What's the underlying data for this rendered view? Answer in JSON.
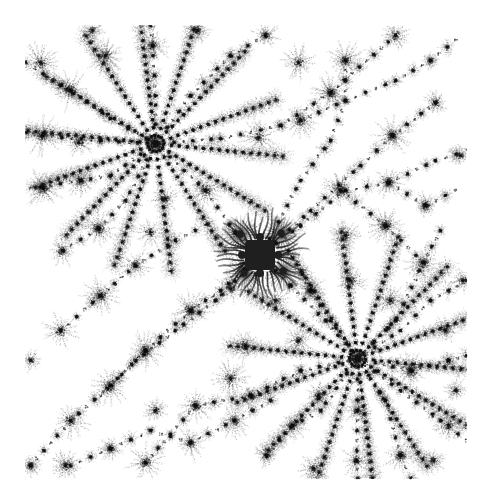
{
  "image": {
    "width": 491,
    "height": 504,
    "background": "#ffffff",
    "ink_color": "#1a1a1a",
    "content_bounds": {
      "x0": 25,
      "y0": 25,
      "x1": 466,
      "y1": 478
    }
  },
  "fractal": {
    "kind": "julia-like dendrite",
    "core": {
      "x": 260,
      "y": 255,
      "size": 30,
      "color": "#1f1f1f"
    },
    "core_satellites": [
      {
        "x": 240,
        "y": 234
      },
      {
        "x": 281,
        "y": 233
      },
      {
        "x": 244,
        "y": 273
      },
      {
        "x": 283,
        "y": 271
      }
    ],
    "major_hubs": [
      {
        "x": 155,
        "y": 143,
        "arms": 14,
        "radius": 135
      },
      {
        "x": 357,
        "y": 358,
        "arms": 14,
        "radius": 135
      }
    ],
    "minor_hubs": [
      {
        "x": 40,
        "y": 62,
        "r": 22
      },
      {
        "x": 70,
        "y": 90,
        "r": 22
      },
      {
        "x": 105,
        "y": 55,
        "r": 22
      },
      {
        "x": 152,
        "y": 45,
        "r": 20
      },
      {
        "x": 92,
        "y": 30,
        "r": 14
      },
      {
        "x": 197,
        "y": 30,
        "r": 16
      },
      {
        "x": 42,
        "y": 135,
        "r": 22
      },
      {
        "x": 78,
        "y": 142,
        "r": 18
      },
      {
        "x": 43,
        "y": 188,
        "r": 22
      },
      {
        "x": 80,
        "y": 180,
        "r": 18
      },
      {
        "x": 98,
        "y": 228,
        "r": 22
      },
      {
        "x": 150,
        "y": 232,
        "r": 20
      },
      {
        "x": 165,
        "y": 198,
        "r": 18
      },
      {
        "x": 205,
        "y": 190,
        "r": 24
      },
      {
        "x": 62,
        "y": 250,
        "r": 18
      },
      {
        "x": 235,
        "y": 232,
        "r": 14
      },
      {
        "x": 298,
        "y": 62,
        "r": 20
      },
      {
        "x": 265,
        "y": 35,
        "r": 16
      },
      {
        "x": 345,
        "y": 60,
        "r": 22
      },
      {
        "x": 395,
        "y": 35,
        "r": 18
      },
      {
        "x": 330,
        "y": 92,
        "r": 22
      },
      {
        "x": 300,
        "y": 120,
        "r": 20
      },
      {
        "x": 258,
        "y": 137,
        "r": 22
      },
      {
        "x": 392,
        "y": 135,
        "r": 22
      },
      {
        "x": 435,
        "y": 102,
        "r": 14
      },
      {
        "x": 388,
        "y": 182,
        "r": 18
      },
      {
        "x": 340,
        "y": 190,
        "r": 22
      },
      {
        "x": 425,
        "y": 205,
        "r": 16
      },
      {
        "x": 423,
        "y": 262,
        "r": 22
      },
      {
        "x": 462,
        "y": 280,
        "r": 14
      },
      {
        "x": 445,
        "y": 330,
        "r": 16
      },
      {
        "x": 411,
        "y": 370,
        "r": 22
      },
      {
        "x": 448,
        "y": 425,
        "r": 18
      },
      {
        "x": 433,
        "y": 460,
        "r": 14
      },
      {
        "x": 400,
        "y": 455,
        "r": 20
      },
      {
        "x": 356,
        "y": 460,
        "r": 18
      },
      {
        "x": 357,
        "y": 410,
        "r": 16
      },
      {
        "x": 313,
        "y": 468,
        "r": 18
      },
      {
        "x": 318,
        "y": 395,
        "r": 16
      },
      {
        "x": 292,
        "y": 425,
        "r": 18
      },
      {
        "x": 266,
        "y": 455,
        "r": 14
      },
      {
        "x": 234,
        "y": 420,
        "r": 20
      },
      {
        "x": 190,
        "y": 442,
        "r": 20
      },
      {
        "x": 145,
        "y": 462,
        "r": 22
      },
      {
        "x": 110,
        "y": 448,
        "r": 14
      },
      {
        "x": 65,
        "y": 465,
        "r": 18
      },
      {
        "x": 30,
        "y": 465,
        "r": 14
      },
      {
        "x": 70,
        "y": 420,
        "r": 22
      },
      {
        "x": 110,
        "y": 385,
        "r": 22
      },
      {
        "x": 145,
        "y": 350,
        "r": 22
      },
      {
        "x": 190,
        "y": 310,
        "r": 24
      },
      {
        "x": 230,
        "y": 288,
        "r": 18
      },
      {
        "x": 60,
        "y": 330,
        "r": 22
      },
      {
        "x": 100,
        "y": 295,
        "r": 22
      },
      {
        "x": 135,
        "y": 265,
        "r": 20
      },
      {
        "x": 30,
        "y": 360,
        "r": 14
      },
      {
        "x": 195,
        "y": 405,
        "r": 22
      },
      {
        "x": 155,
        "y": 410,
        "r": 14
      },
      {
        "x": 230,
        "y": 378,
        "r": 22
      },
      {
        "x": 245,
        "y": 345,
        "r": 18
      },
      {
        "x": 275,
        "y": 300,
        "r": 22
      },
      {
        "x": 298,
        "y": 340,
        "r": 16
      },
      {
        "x": 310,
        "y": 290,
        "r": 20
      },
      {
        "x": 350,
        "y": 280,
        "r": 18
      },
      {
        "x": 390,
        "y": 300,
        "r": 18
      },
      {
        "x": 385,
        "y": 225,
        "r": 22
      },
      {
        "x": 345,
        "y": 235,
        "r": 18
      },
      {
        "x": 460,
        "y": 155,
        "r": 14
      },
      {
        "x": 455,
        "y": 390,
        "r": 14
      }
    ],
    "chains": [
      [
        [
          25,
          62
        ],
        [
          70,
          90
        ],
        [
          110,
          118
        ],
        [
          155,
          143
        ]
      ],
      [
        [
          155,
          143
        ],
        [
          205,
          190
        ],
        [
          235,
          232
        ],
        [
          260,
          255
        ]
      ],
      [
        [
          260,
          255
        ],
        [
          290,
          285
        ],
        [
          325,
          320
        ],
        [
          357,
          358
        ]
      ],
      [
        [
          357,
          358
        ],
        [
          400,
          390
        ],
        [
          440,
          420
        ],
        [
          466,
          440
        ]
      ],
      [
        [
          155,
          143
        ],
        [
          220,
          138
        ],
        [
          280,
          125
        ],
        [
          330,
          92
        ],
        [
          395,
          35
        ]
      ],
      [
        [
          155,
          143
        ],
        [
          110,
          175
        ],
        [
          80,
          180
        ],
        [
          30,
          188
        ]
      ],
      [
        [
          155,
          143
        ],
        [
          155,
          95
        ],
        [
          152,
          45
        ],
        [
          150,
          25
        ]
      ],
      [
        [
          155,
          143
        ],
        [
          100,
          140
        ],
        [
          42,
          135
        ],
        [
          25,
          132
        ]
      ],
      [
        [
          155,
          143
        ],
        [
          125,
          200
        ],
        [
          98,
          228
        ],
        [
          62,
          250
        ]
      ],
      [
        [
          155,
          143
        ],
        [
          190,
          95
        ],
        [
          230,
          55
        ],
        [
          265,
          35
        ]
      ],
      [
        [
          260,
          255
        ],
        [
          300,
          225
        ],
        [
          345,
          190
        ],
        [
          388,
          182
        ],
        [
          435,
          160
        ],
        [
          466,
          150
        ]
      ],
      [
        [
          260,
          255
        ],
        [
          310,
          210
        ],
        [
          360,
          165
        ],
        [
          392,
          135
        ],
        [
          435,
          102
        ]
      ],
      [
        [
          260,
          255
        ],
        [
          300,
          180
        ],
        [
          330,
          140
        ],
        [
          345,
          100
        ],
        [
          345,
          60
        ]
      ],
      [
        [
          260,
          255
        ],
        [
          220,
          290
        ],
        [
          190,
          310
        ],
        [
          145,
          350
        ],
        [
          110,
          385
        ],
        [
          70,
          420
        ],
        [
          30,
          465
        ]
      ],
      [
        [
          260,
          255
        ],
        [
          215,
          300
        ],
        [
          175,
          330
        ],
        [
          135,
          360
        ],
        [
          100,
          395
        ]
      ],
      [
        [
          357,
          358
        ],
        [
          300,
          370
        ],
        [
          250,
          395
        ],
        [
          195,
          405
        ],
        [
          145,
          462
        ]
      ],
      [
        [
          357,
          358
        ],
        [
          357,
          410
        ],
        [
          356,
          460
        ],
        [
          357,
          478
        ]
      ],
      [
        [
          357,
          358
        ],
        [
          400,
          330
        ],
        [
          430,
          300
        ],
        [
          466,
          280
        ]
      ],
      [
        [
          357,
          358
        ],
        [
          410,
          370
        ],
        [
          448,
          360
        ],
        [
          466,
          355
        ]
      ],
      [
        [
          357,
          358
        ],
        [
          320,
          410
        ],
        [
          292,
          425
        ],
        [
          266,
          455
        ]
      ],
      [
        [
          357,
          358
        ],
        [
          385,
          400
        ],
        [
          400,
          455
        ],
        [
          410,
          478
        ]
      ],
      [
        [
          357,
          358
        ],
        [
          330,
          320
        ],
        [
          310,
          290
        ],
        [
          298,
          265
        ]
      ],
      [
        [
          357,
          358
        ],
        [
          395,
          320
        ],
        [
          423,
          262
        ],
        [
          440,
          230
        ]
      ],
      [
        [
          60,
          330
        ],
        [
          100,
          295
        ],
        [
          135,
          265
        ],
        [
          175,
          240
        ],
        [
          205,
          225
        ]
      ],
      [
        [
          70,
          465
        ],
        [
          110,
          448
        ],
        [
          150,
          430
        ],
        [
          190,
          442
        ],
        [
          234,
          420
        ],
        [
          270,
          400
        ]
      ],
      [
        [
          300,
          120
        ],
        [
          345,
          100
        ],
        [
          395,
          80
        ],
        [
          430,
          60
        ],
        [
          455,
          40
        ]
      ],
      [
        [
          388,
          182
        ],
        [
          425,
          205
        ],
        [
          455,
          190
        ]
      ],
      [
        [
          340,
          190
        ],
        [
          385,
          225
        ],
        [
          423,
          262
        ]
      ]
    ],
    "seed": 20240611
  }
}
